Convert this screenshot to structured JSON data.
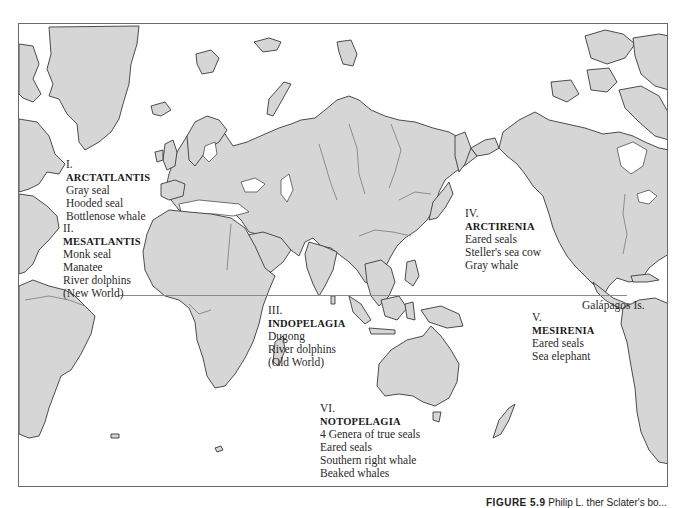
{
  "map": {
    "frame_color": "#6a6a6a",
    "land_color": "#d6d6d6",
    "coast_color": "#3a3a3a",
    "water_color": "#ffffff",
    "equator_line": true
  },
  "regions": [
    {
      "numeral": "I.",
      "name": "ARCTATLANTIS",
      "species": [
        "Gray seal",
        "Hooded seal",
        "Bottlenose whale"
      ]
    },
    {
      "numeral": "II.",
      "name": "MESATLANTIS",
      "species": [
        "Monk seal",
        "Manatee",
        "River dolphins",
        "(New World)"
      ]
    },
    {
      "numeral": "III.",
      "name": "INDOPELAGIA",
      "species": [
        "Dugong",
        "River dolphins",
        "(Old World)"
      ]
    },
    {
      "numeral": "IV.",
      "name": "ARCTIRENIA",
      "species": [
        "Eared seals",
        "Steller's sea cow",
        "Gray whale"
      ]
    },
    {
      "numeral": "V.",
      "name": "MESIRENIA",
      "species": [
        "Eared seals",
        "Sea elephant"
      ]
    },
    {
      "numeral": "VI.",
      "name": "NOTOPELAGIA",
      "species": [
        "4 Genera of true seals",
        "Eared seals",
        "Southern right whale",
        "Beaked whales"
      ]
    }
  ],
  "labels": {
    "galapagos": "Galápagos Is."
  },
  "caption": {
    "figure": "FIGURE 5.9",
    "text": "Philip L. ther Sclater's bo..."
  }
}
